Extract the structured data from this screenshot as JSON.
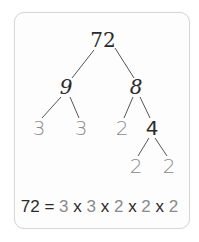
{
  "diagram": {
    "colors": {
      "composite": "#2a2a2a",
      "prime": "#8a8a8a",
      "line": "#555555",
      "card_border": "#d6d6d6"
    },
    "nodes": {
      "root": "72",
      "left": "9",
      "right": "8",
      "left_left": "3",
      "left_right": "3",
      "right_left": "2",
      "right_right": "4",
      "right_right_left": "2",
      "right_right_right": "2"
    },
    "equation": {
      "lhs": "72",
      "equals": "=",
      "factors": [
        "3",
        "3",
        "2",
        "2",
        "2"
      ],
      "operator": "x"
    }
  }
}
